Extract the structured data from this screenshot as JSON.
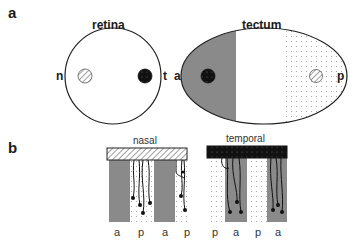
{
  "panels": {
    "a": {
      "label": "a",
      "retina": {
        "title": "retina",
        "left_label": "n",
        "right_label": "t",
        "nasal_spot": "hatched",
        "temporal_spot": "black"
      },
      "tectum": {
        "title": "tectum",
        "left_label": "a",
        "right_label": "p",
        "anterior_region": "gray",
        "posterior_region": "dotted",
        "anterior_spot": "black",
        "posterior_spot": "hatched"
      }
    },
    "b": {
      "label": "b",
      "nasal": {
        "title": "nasal",
        "bar_pattern": "hatched",
        "stripe_labels": [
          "a",
          "p",
          "a",
          "p"
        ],
        "stripe_fills": [
          "gray",
          "dotted",
          "gray",
          "dotted"
        ],
        "axons_grow_on": "p"
      },
      "temporal": {
        "title": "temporal",
        "bar_pattern": "black",
        "stripe_labels": [
          "p",
          "a",
          "p",
          "a"
        ],
        "stripe_fills": [
          "dotted",
          "gray",
          "dotted",
          "gray"
        ],
        "axons_grow_on": "a"
      }
    }
  },
  "colors": {
    "gray": "#8a8a8a",
    "black": "#111111",
    "line": "#222222",
    "dots": "#9a9a9a"
  }
}
